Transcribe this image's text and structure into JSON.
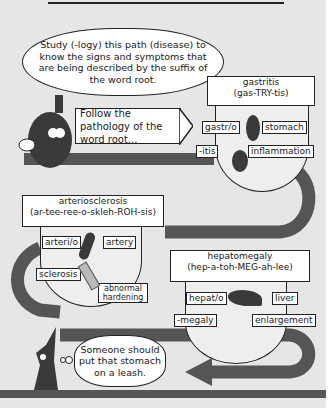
{
  "intro_bubble": {
    "text": "Study (-logy) this path (disease) to know the signs and symptoms that are being described by the suffix of the word root."
  },
  "signpost": {
    "text": "Follow the pathology of the word root..."
  },
  "terms": [
    {
      "term": "gastritis",
      "pronunciation": "(gas-TRY-tis)",
      "parts": [
        {
          "part": "gastr/o",
          "meaning": "stomach",
          "icon": "stomach-icon"
        },
        {
          "part": "-itis",
          "meaning": "inflammation",
          "icon": "inflamed-stomach-icon"
        }
      ]
    },
    {
      "term": "arteriosclerosis",
      "pronunciation": "(ar-tee-ree-o-skleh-ROH-sis)",
      "parts": [
        {
          "part": "arteri/o",
          "meaning": "artery",
          "icon": "artery-icon"
        },
        {
          "part": "sclerosis",
          "meaning": "abnormal hardening",
          "icon": "hardened-pipe-icon"
        }
      ]
    },
    {
      "term": "hepatomegaly",
      "pronunciation": "(hep-a-toh-MEG-ah-lee)",
      "parts": [
        {
          "part": "hepat/o",
          "meaning": "liver",
          "icon": "liver-icon"
        },
        {
          "part": "-megaly",
          "meaning": "enlargement",
          "icon": "arrow-icon"
        }
      ]
    }
  ],
  "thought_bubble": {
    "text": "Someone should put that stomach on a leash."
  },
  "colors": {
    "background": "#e6e6e6",
    "road": "#555555",
    "character": "#3a3a3a"
  }
}
